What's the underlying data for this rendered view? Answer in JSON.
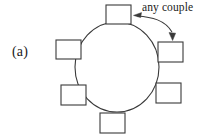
{
  "figure": {
    "panel_label": "(a)",
    "annotation": "any couple",
    "stroke_color": "#3a3a3a",
    "text_color": "#1a1a1a",
    "background_color": "#ffffff",
    "fill_color": "#ffffff"
  },
  "diagram": {
    "type": "round-table-seating",
    "table": {
      "shape": "circle",
      "center_x": 117,
      "center_y": 67,
      "radius_x": 42,
      "radius_y": 45
    },
    "seats": [
      {
        "id": "seat-top",
        "x": 106,
        "y": 5,
        "w": 25,
        "h": 19,
        "angle_deg": 90
      },
      {
        "id": "seat-upper-right",
        "x": 158,
        "y": 42,
        "w": 25,
        "h": 20,
        "angle_deg": 30
      },
      {
        "id": "seat-lower-right",
        "x": 156,
        "y": 83,
        "w": 25,
        "h": 20,
        "angle_deg": 330
      },
      {
        "id": "seat-bottom",
        "x": 100,
        "y": 113,
        "w": 25,
        "h": 20,
        "angle_deg": 270
      },
      {
        "id": "seat-lower-left",
        "x": 61,
        "y": 85,
        "w": 25,
        "h": 20,
        "angle_deg": 210
      },
      {
        "id": "seat-upper-left",
        "x": 56,
        "y": 40,
        "w": 25,
        "h": 19,
        "angle_deg": 150
      }
    ],
    "callout": {
      "label": "any couple",
      "points_to": [
        "seat-top",
        "seat-upper-right"
      ],
      "arrowheads": 2
    }
  }
}
